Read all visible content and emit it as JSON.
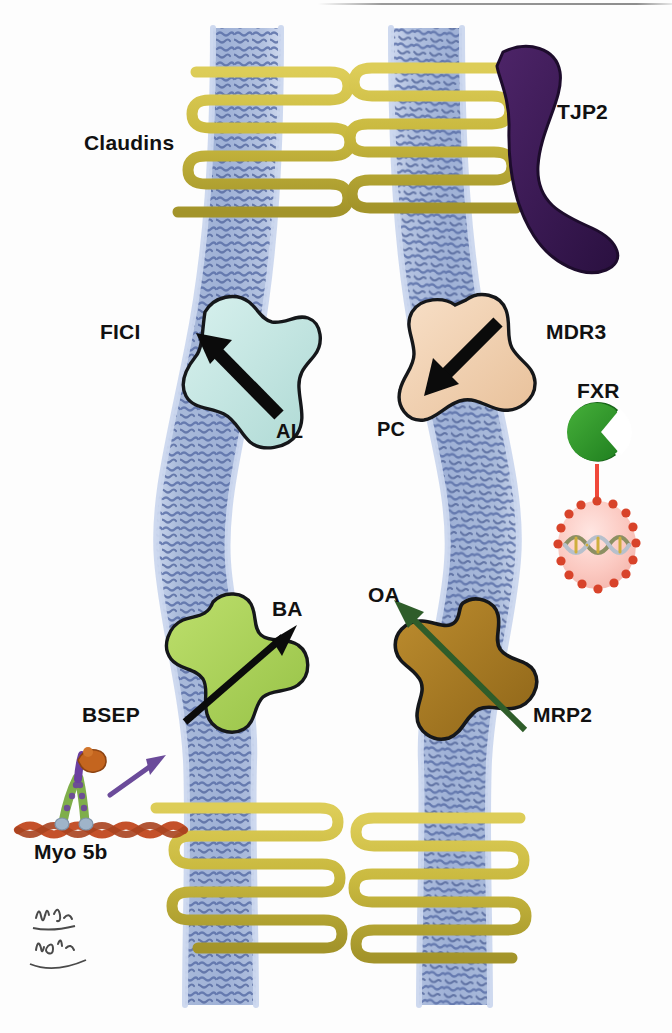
{
  "figure": {
    "kind": "biological-schematic",
    "background_color": "#ffffff"
  },
  "labels": {
    "claudins": "Claudins",
    "tjp2": "TJP2",
    "fic1": "FICI",
    "al": "AL",
    "mdr3": "MDR3",
    "pc": "PC",
    "fxr": "FXR",
    "ba": "BA",
    "bsep": "BSEP",
    "oa": "OA",
    "mrp2": "MRP2",
    "myo5b": "Myo 5b"
  },
  "colors": {
    "membrane_fill": "#a9bada",
    "membrane_light": "#c5d2e9",
    "membrane_tails": "#5b70a8",
    "claudin": "#c9b93f",
    "claudin_shade": "#a99a2c",
    "tjp2": "#3d1a56",
    "fic1": "#bfe4e0",
    "mdr3": "#f0cfae",
    "bsep": "#a9d159",
    "mrp2": "#a87a26",
    "fxr": "#2e9c2e",
    "nucleus_fill": "#fbcfc8",
    "nucleus_border": "#d8432a",
    "fxr_arrow": "#f0483a",
    "mrp2_arrow": "#2f5d2a",
    "myo_arrow": "#6b4b9a",
    "actin": "#c4512a",
    "outline": "#111111",
    "top_rule": "#9a9a9a"
  },
  "elements": {
    "tight_junction_top": {
      "name": "tight-junction-top",
      "strand_count": 4
    },
    "tight_junction_bottom": {
      "name": "tight-junction-bottom",
      "strand_count": 4
    },
    "canaliculus_lumen": {
      "name": "canaliculus-lumen",
      "fill": "#ffffff"
    },
    "transporters": [
      {
        "id": "fic1",
        "label": "FICI",
        "substrate": "AL",
        "arrow_direction": "up-left",
        "fill": "#bfe4e0",
        "side": "left"
      },
      {
        "id": "mdr3",
        "label": "MDR3",
        "substrate": "PC",
        "arrow_direction": "down-left",
        "fill": "#f0cfae",
        "side": "right"
      },
      {
        "id": "bsep",
        "label": "BSEP",
        "substrate": "BA",
        "arrow_direction": "up-right",
        "fill": "#a9d159",
        "side": "left"
      },
      {
        "id": "mrp2",
        "label": "MRP2",
        "substrate": "OA",
        "arrow_direction": "up-left",
        "fill": "#a87a26",
        "side": "right"
      }
    ],
    "fxr_signaling": {
      "receptor": "FXR",
      "target": "nucleus",
      "arrow_color": "#f0483a"
    },
    "myosin": {
      "label": "Myo 5b",
      "filament": "actin",
      "arrow_color": "#6b4b9a"
    },
    "signature": {
      "name": "artist-signature",
      "legible": false
    }
  }
}
